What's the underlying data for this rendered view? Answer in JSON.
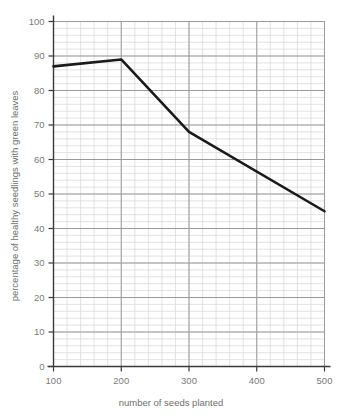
{
  "chart_data": {
    "type": "line",
    "title": "",
    "subtitle": "",
    "xlabel": "number of seeds planted",
    "ylabel": "percentage of healthy seedlings with green leaves",
    "xlim": [
      100,
      500
    ],
    "ylim": [
      0,
      100
    ],
    "x_ticks": [
      100,
      200,
      300,
      400,
      500
    ],
    "x_tick_labels": [
      "100",
      "200",
      "300",
      "400",
      "500"
    ],
    "y_ticks": [
      0,
      10,
      20,
      30,
      40,
      50,
      60,
      70,
      80,
      90,
      100
    ],
    "y_tick_labels": [
      "0",
      "10",
      "20",
      "30",
      "40",
      "50",
      "60",
      "70",
      "80",
      "90",
      "100"
    ],
    "x_minor_step": 20,
    "y_minor_step": 2,
    "grid": true,
    "grid_major_color": "#9a9a9a",
    "grid_minor_color": "#d5d5d5",
    "legend": false,
    "legend_position": "none",
    "annotations": [],
    "series": [
      {
        "name": "healthy seedlings",
        "color": "#1a1a1a",
        "line_width": 2.6,
        "x": [
          100,
          200,
          300,
          500
        ],
        "values": [
          87,
          89,
          68,
          45
        ],
        "points": [
          {
            "x": 100,
            "y": 87
          },
          {
            "x": 200,
            "y": 89
          },
          {
            "x": 300,
            "y": 68
          },
          {
            "x": 500,
            "y": 45
          }
        ]
      }
    ]
  },
  "axis_titles": {
    "x": "number of seeds planted",
    "y": "percentage of healthy seedlings with green leaves"
  },
  "colors": {
    "line": "#1a1a1a",
    "axis": "#3a3a3a",
    "grid_major": "#9a9a9a",
    "grid_minor": "#d5d5d5",
    "text": "#7a7a7a",
    "background": "#ffffff"
  }
}
